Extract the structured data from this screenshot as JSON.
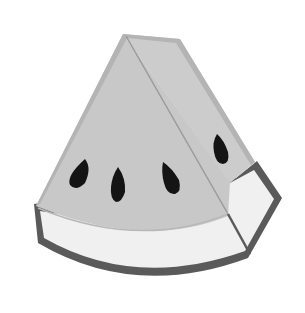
{
  "image": {
    "subject": "watermelon-slice",
    "style": "grayscale flat illustration",
    "seed_count": 4
  },
  "colors": {
    "background": "#ffffff",
    "flesh": "#c8c8c8",
    "flesh_edge": "#b4b4b4",
    "side_face": "#cfcfcf",
    "rind_inner": "#f0f0f0",
    "rind_outline": "#5a5a5a",
    "seed": "#141414",
    "crease_line": "#9a9a9a"
  }
}
